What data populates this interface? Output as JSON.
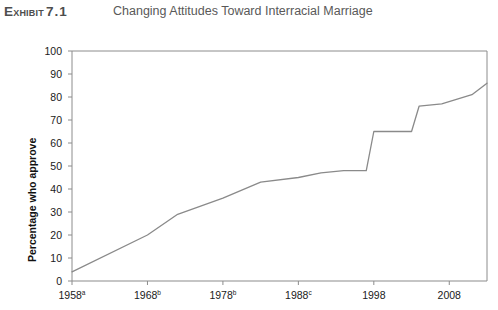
{
  "header": {
    "exhibit_word": "Exhibit",
    "exhibit_number": "7.1",
    "title": "Changing Attitudes Toward Interracial Marriage"
  },
  "colors": {
    "line": "#8a8a8a",
    "axis": "#8c8c8c",
    "text": "#1a1a1a",
    "title_text": "#595959",
    "background": "#ffffff"
  },
  "chart_data": {
    "type": "line",
    "title": "Changing Attitudes Toward Interracial Marriage",
    "xlabel": "",
    "ylabel": "Percentage who approve",
    "xlim": [
      1958,
      2013
    ],
    "ylim": [
      0,
      100
    ],
    "ytick_step": 10,
    "grid": false,
    "legend": "none",
    "yticks": [
      0,
      10,
      20,
      30,
      40,
      50,
      60,
      70,
      80,
      90,
      100
    ],
    "ytick_labels": [
      "0",
      "10",
      "20",
      "30",
      "40",
      "50",
      "60",
      "70",
      "80",
      "90",
      "100"
    ],
    "xticks": [
      1958,
      1968,
      1978,
      1988,
      1998,
      2008
    ],
    "xtick_labels": [
      "1958",
      "1968",
      "1978",
      "1988",
      "1998",
      "2008"
    ],
    "xtick_footnotes": [
      "a",
      "b",
      "b",
      "c",
      "",
      ""
    ],
    "series": [
      {
        "name": "Percentage who approve",
        "x": [
          1958,
          1968,
          1972,
          1978,
          1983,
          1988,
          1991,
          1994,
          1997,
          1998,
          2002,
          2003,
          2004,
          2007,
          2011,
          2013
        ],
        "values": [
          4,
          20,
          29,
          36,
          43,
          45,
          47,
          48,
          48,
          65,
          65,
          65,
          76,
          77,
          81,
          86
        ]
      }
    ]
  }
}
